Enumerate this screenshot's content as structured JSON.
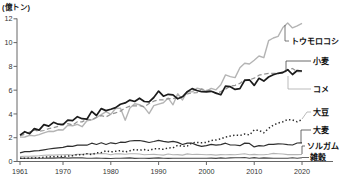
{
  "chart_data": {
    "type": "line",
    "title": "",
    "unit_label": "(億トン)",
    "xlabel": "",
    "ylabel": "",
    "x_axis": {
      "ticks": [
        1961,
        1970,
        1980,
        1990,
        2000,
        2010,
        2020
      ],
      "range": [
        1961,
        2020
      ]
    },
    "y_axis": {
      "ticks": [
        0,
        2,
        4,
        6,
        8,
        10,
        12
      ],
      "range": [
        0,
        12
      ]
    },
    "grid": "off",
    "legend_position": "right-edge-leader-labels",
    "years": [
      1961,
      1962,
      1963,
      1964,
      1965,
      1966,
      1967,
      1968,
      1969,
      1970,
      1971,
      1972,
      1973,
      1974,
      1975,
      1976,
      1977,
      1978,
      1979,
      1980,
      1981,
      1982,
      1983,
      1984,
      1985,
      1986,
      1987,
      1988,
      1989,
      1990,
      1991,
      1992,
      1993,
      1994,
      1995,
      1996,
      1997,
      1998,
      1999,
      2000,
      2001,
      2002,
      2003,
      2004,
      2005,
      2006,
      2007,
      2008,
      2009,
      2010,
      2011,
      2012,
      2013,
      2014,
      2015,
      2016,
      2017,
      2018,
      2019,
      2020
    ],
    "series": [
      {
        "key": "corn",
        "name": "トウモロコシ",
        "color": "#b4b4b4",
        "line_style": "solid",
        "values": [
          2.05,
          2.06,
          2.2,
          2.15,
          2.26,
          2.41,
          2.54,
          2.52,
          2.67,
          2.65,
          3.05,
          3.01,
          3.12,
          2.93,
          3.42,
          3.5,
          3.7,
          3.94,
          4.19,
          3.96,
          4.46,
          4.49,
          3.47,
          4.5,
          4.85,
          4.78,
          4.55,
          4.03,
          4.7,
          4.83,
          4.94,
          5.33,
          4.77,
          5.69,
          5.17,
          5.89,
          5.85,
          6.16,
          6.07,
          5.92,
          6.15,
          6.03,
          6.45,
          7.28,
          7.14,
          7.06,
          7.89,
          8.27,
          8.2,
          8.52,
          8.87,
          8.73,
          10.16,
          10.39,
          10.52,
          11.27,
          11.64,
          11.24,
          11.41,
          11.62
        ]
      },
      {
        "key": "wheat",
        "name": "小麦",
        "color": "#1c1c1c",
        "line_style": "solid",
        "values": [
          2.22,
          2.51,
          2.34,
          2.77,
          2.64,
          3.1,
          2.98,
          3.3,
          3.14,
          3.1,
          3.48,
          3.43,
          3.77,
          3.6,
          3.56,
          4.21,
          3.87,
          4.45,
          4.28,
          4.4,
          4.53,
          4.81,
          4.93,
          5.16,
          5.05,
          5.32,
          5.05,
          5.02,
          5.38,
          5.92,
          5.49,
          5.65,
          5.61,
          5.27,
          5.44,
          5.87,
          6.13,
          5.97,
          5.87,
          5.86,
          5.9,
          5.75,
          5.61,
          6.33,
          6.29,
          6.06,
          6.13,
          6.83,
          6.87,
          6.4,
          7.0,
          6.76,
          7.11,
          7.3,
          7.42,
          7.49,
          7.72,
          7.32,
          7.65,
          7.61
        ]
      },
      {
        "key": "rice",
        "name": "コメ",
        "color": "#949494",
        "line_style": "dashed",
        "values": [
          2.16,
          2.29,
          2.48,
          2.63,
          2.54,
          2.61,
          2.77,
          2.84,
          2.95,
          3.16,
          3.18,
          3.07,
          3.35,
          3.33,
          3.57,
          3.49,
          3.72,
          3.85,
          3.75,
          3.97,
          4.1,
          4.23,
          4.5,
          4.66,
          4.68,
          4.69,
          4.61,
          4.88,
          5.07,
          5.19,
          5.19,
          5.28,
          5.29,
          5.39,
          5.47,
          5.69,
          5.77,
          5.79,
          6.11,
          5.99,
          5.98,
          5.71,
          5.88,
          6.08,
          6.34,
          6.41,
          6.57,
          6.89,
          6.87,
          7.01,
          7.26,
          7.35,
          7.41,
          7.41,
          7.4,
          7.41,
          7.7,
          7.82,
          7.55,
          7.57
        ]
      },
      {
        "key": "soybean",
        "name": "大豆",
        "color": "#2a2a2a",
        "line_style": "dotted",
        "values": [
          0.27,
          0.28,
          0.29,
          0.3,
          0.32,
          0.36,
          0.38,
          0.4,
          0.42,
          0.44,
          0.46,
          0.49,
          0.58,
          0.55,
          0.66,
          0.59,
          0.72,
          0.75,
          0.89,
          0.81,
          0.86,
          0.92,
          0.8,
          0.9,
          1.01,
          0.95,
          1.0,
          0.93,
          1.07,
          1.08,
          1.03,
          1.14,
          1.15,
          1.36,
          1.27,
          1.3,
          1.58,
          1.6,
          1.58,
          1.61,
          1.77,
          1.81,
          1.9,
          2.06,
          2.14,
          2.22,
          2.19,
          2.31,
          2.23,
          2.65,
          2.62,
          2.41,
          2.78,
          3.06,
          3.23,
          3.35,
          3.53,
          3.49,
          3.34,
          3.53
        ]
      },
      {
        "key": "barley",
        "name": "大麦",
        "color": "#2f2f2f",
        "line_style": "solid",
        "values": [
          0.72,
          0.83,
          0.83,
          0.9,
          0.92,
          0.98,
          1.05,
          1.1,
          1.15,
          1.19,
          1.29,
          1.28,
          1.37,
          1.39,
          1.37,
          1.54,
          1.43,
          1.57,
          1.43,
          1.57,
          1.5,
          1.62,
          1.61,
          1.72,
          1.75,
          1.77,
          1.69,
          1.6,
          1.68,
          1.78,
          1.7,
          1.63,
          1.69,
          1.61,
          1.43,
          1.55,
          1.54,
          1.38,
          1.28,
          1.33,
          1.44,
          1.37,
          1.42,
          1.54,
          1.39,
          1.39,
          1.33,
          1.55,
          1.52,
          1.23,
          1.33,
          1.3,
          1.44,
          1.44,
          1.49,
          1.47,
          1.42,
          1.39,
          1.56,
          1.57
        ]
      },
      {
        "key": "sorghum",
        "name": "ソルガム",
        "color": "#b4b4b4",
        "line_style": "solid",
        "values": [
          0.41,
          0.44,
          0.44,
          0.45,
          0.48,
          0.52,
          0.55,
          0.54,
          0.57,
          0.56,
          0.59,
          0.54,
          0.61,
          0.6,
          0.64,
          0.64,
          0.66,
          0.67,
          0.65,
          0.57,
          0.66,
          0.64,
          0.61,
          0.66,
          0.66,
          0.63,
          0.57,
          0.59,
          0.6,
          0.57,
          0.54,
          0.63,
          0.56,
          0.58,
          0.54,
          0.64,
          0.59,
          0.6,
          0.59,
          0.56,
          0.58,
          0.54,
          0.58,
          0.57,
          0.59,
          0.56,
          0.61,
          0.65,
          0.56,
          0.6,
          0.57,
          0.57,
          0.61,
          0.68,
          0.66,
          0.63,
          0.58,
          0.59,
          0.58,
          0.59
        ]
      },
      {
        "key": "millet",
        "name": "雑穀",
        "color": "#474747",
        "line_style": "solid",
        "values": [
          0.26,
          0.27,
          0.28,
          0.28,
          0.27,
          0.28,
          0.29,
          0.29,
          0.3,
          0.33,
          0.29,
          0.3,
          0.31,
          0.3,
          0.28,
          0.28,
          0.29,
          0.28,
          0.26,
          0.25,
          0.27,
          0.28,
          0.29,
          0.3,
          0.26,
          0.28,
          0.27,
          0.26,
          0.29,
          0.3,
          0.27,
          0.26,
          0.27,
          0.27,
          0.27,
          0.28,
          0.28,
          0.27,
          0.27,
          0.28,
          0.29,
          0.26,
          0.3,
          0.28,
          0.3,
          0.32,
          0.32,
          0.34,
          0.28,
          0.33,
          0.27,
          0.3,
          0.29,
          0.28,
          0.28,
          0.28,
          0.28,
          0.31,
          0.28,
          0.31
        ]
      }
    ]
  }
}
